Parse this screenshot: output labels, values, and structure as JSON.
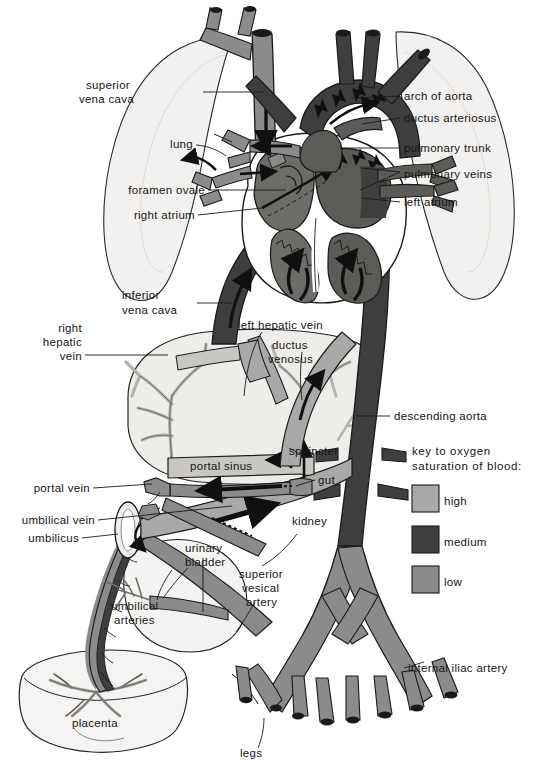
{
  "figure": {
    "background": "#ffffff"
  },
  "palette": {
    "high": "#a9a9a9",
    "medium": "#3e3e3e",
    "low": "#8b8b8b",
    "organ_fill": "#f2f1ef",
    "organ_fill_2": "#eceae7",
    "outline": "#1a1a1a",
    "text": "#151515"
  },
  "key": {
    "title_line1": "key to oxygen",
    "title_line2": "saturation of blood:",
    "entries": [
      {
        "label": "high",
        "color": "#a9a9a9"
      },
      {
        "label": "medium",
        "color": "#3e3e3e"
      },
      {
        "label": "low",
        "color": "#8b8b8b"
      }
    ]
  },
  "labels": {
    "superior_vena_cava_line1": "superior",
    "superior_vena_cava_line2": "vena cava",
    "lung": "lung",
    "foramen_ovale": "foramen ovale",
    "right_atrium": "right atrium",
    "inferior_vena_cava_line1": "inferior",
    "inferior_vena_cava_line2": "vena cava",
    "right_hepatic_vein_line1": "right",
    "right_hepatic_vein_line2": "hepatic",
    "right_hepatic_vein_line3": "vein",
    "left_hepatic_vein": "left  hepatic vein",
    "ductus_venosus_line1": "ductus",
    "ductus_venosus_line2": "venosus",
    "portal_sinus": "portal  sinus",
    "sphincter": "sphincter",
    "gut": "gut",
    "portal_vein": "portal  vein",
    "umbilical_vein": "umbilical vein",
    "umbilicus": "umbilicus",
    "umbilical_arteries_line1": "umbilical",
    "umbilical_arteries_line2": "arteries",
    "urinary_bladder_line1": "urinary",
    "urinary_bladder_line2": "bladder",
    "superior_vesical_artery_line1": "superior",
    "superior_vesical_artery_line2": "vesical",
    "superior_vesical_artery_line3": "artery",
    "kidney": "kidney",
    "placenta": "placenta",
    "legs": "legs",
    "arch_of_aorta": "arch of aorta",
    "ductus_arteriosus": "ductus arteriosus",
    "pulmonary_trunk": "pulmonary trunk",
    "pulmonary_veins": "pulmonary veins",
    "left_atrium": "left atrium",
    "descending_aorta": "descending aorta",
    "internal_iliac_artery": "internal iliac artery"
  }
}
